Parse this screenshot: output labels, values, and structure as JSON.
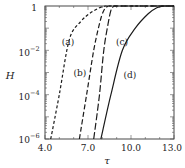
{
  "chart_data": {
    "type": "line",
    "title": "",
    "xlabel": "τ",
    "ylabel": "H",
    "xlim": [
      4.0,
      13.0
    ],
    "ylim": [
      1e-06,
      1
    ],
    "yscale": "log",
    "xticks": [
      "4.0",
      "7.0",
      "10.0",
      "13.0"
    ],
    "yticks": [
      {
        "base": "1",
        "exp": ""
      },
      {
        "base": "10",
        "exp": "−2"
      },
      {
        "base": "10",
        "exp": "−4"
      },
      {
        "base": "10",
        "exp": "−6"
      }
    ],
    "grid": false,
    "legend": "inline labels",
    "series": [
      {
        "name": "(a)",
        "style": "short-dash",
        "x": [
          4.4,
          5.0,
          5.7,
          6.5,
          7.2,
          7.8,
          8.2
        ],
        "log10y": [
          -6,
          -4,
          -1.5,
          -0.7,
          -0.3,
          -0.08,
          0
        ]
      },
      {
        "name": "(b)",
        "style": "medium-dash",
        "x": [
          6.4,
          6.9,
          7.4,
          7.8,
          8.1,
          8.4
        ],
        "log10y": [
          -6,
          -4,
          -2,
          -0.8,
          -0.2,
          0
        ]
      },
      {
        "name": "(c)",
        "style": "long-dash",
        "x": [
          7.4,
          7.8,
          8.1,
          8.4,
          8.6,
          8.8
        ],
        "log10y": [
          -6,
          -4,
          -2,
          -0.8,
          -0.2,
          0
        ]
      },
      {
        "name": "(d)",
        "style": "solid",
        "x": [
          7.9,
          8.6,
          9.4,
          10.3,
          11.2,
          11.8,
          12.3
        ],
        "log10y": [
          -6,
          -4,
          -2,
          -1,
          -0.35,
          -0.08,
          0
        ]
      }
    ]
  },
  "labels": {
    "a": "(a)",
    "b": "(b)",
    "c": "(c)",
    "d": "(d)",
    "x_axis": "τ",
    "y_axis": "H",
    "xtick_0": "4.0",
    "xtick_1": "7.0",
    "xtick_2": "10.0",
    "xtick_3": "13.0",
    "ytick_0": "1",
    "ytick_1_base": "10",
    "ytick_1_exp": "−2",
    "ytick_2_base": "10",
    "ytick_2_exp": "−4",
    "ytick_3_base": "10",
    "ytick_3_exp": "−6"
  }
}
